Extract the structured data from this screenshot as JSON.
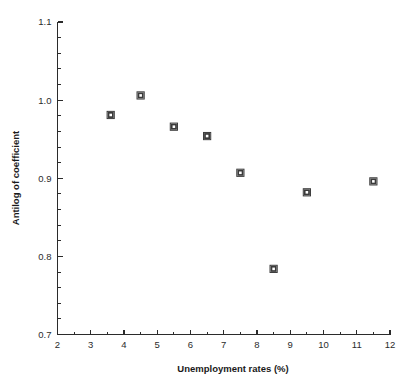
{
  "chart_data": {
    "type": "scatter",
    "title": "",
    "xlabel": "Unemployment rates (%)",
    "ylabel": "Antilog of coefficient",
    "xlim": [
      2,
      12
    ],
    "ylim": [
      0.7,
      1.1
    ],
    "grid": false,
    "legend": null,
    "x_ticks": [
      "2",
      "3",
      "4",
      "5",
      "6",
      "7",
      "8",
      "9",
      "10",
      "11",
      "12"
    ],
    "x_tick_values": [
      2,
      3,
      4,
      5,
      6,
      7,
      8,
      9,
      10,
      11,
      12
    ],
    "x_minor_step": 0.5,
    "y_ticks": [
      "0.7",
      "0.8",
      "0.9",
      "1.0",
      "1.1"
    ],
    "y_tick_values": [
      0.7,
      0.8,
      0.9,
      1.0,
      1.1
    ],
    "y_minor_step": 0.02,
    "marker": "open-square",
    "marker_color": "#3a3a3a",
    "points": [
      {
        "x": 3.6,
        "y": 0.981
      },
      {
        "x": 4.5,
        "y": 1.006
      },
      {
        "x": 5.5,
        "y": 0.966
      },
      {
        "x": 6.5,
        "y": 0.954
      },
      {
        "x": 7.5,
        "y": 0.907
      },
      {
        "x": 8.5,
        "y": 0.784
      },
      {
        "x": 9.5,
        "y": 0.882
      },
      {
        "x": 11.5,
        "y": 0.896
      }
    ]
  },
  "axes": {
    "x_axis_label": "Unemployment rates (%)",
    "y_axis_label": "Antilog of coefficient"
  },
  "colors": {
    "axis": "#2b2b2b",
    "marker": "#3a3a3a",
    "background": "#ffffff",
    "text": "#1a1a1a"
  }
}
